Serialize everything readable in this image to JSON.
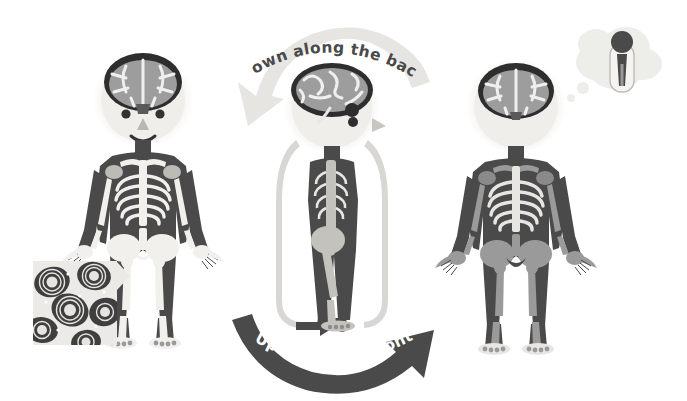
{
  "illustration": {
    "title": "Cerebrospinal fluid circulation through the body",
    "background_color": "#ffffff"
  },
  "palette": {
    "ink_dark": "#3a3a3a",
    "body_dark": "#4a4a4a",
    "bone_light": "#f2f0ec",
    "bone_mid": "#9a9a9a",
    "brain_gray": "#9d9d9d",
    "skin_light": "#eceae6",
    "arrow_light": "#e6e5e2",
    "arrow_dark": "#4a4a4a",
    "text_on_light": "#4a4a4a",
    "text_on_dark": "#ffffff"
  },
  "arrows": {
    "top": {
      "label": "...Down along the back...",
      "fill": "#e6e5e2",
      "text_color": "#4a4a4a",
      "direction": "down-left"
    },
    "bottom": {
      "label": "...Up along the front...",
      "fill": "#4a4a4a",
      "text_color": "#ffffff",
      "direction": "up-right"
    }
  },
  "figures": [
    {
      "id": "left-figure",
      "view": "front",
      "has_face": true,
      "face": {
        "eyes": 2,
        "nose": "triangle",
        "mouth": "smile"
      },
      "brain_view": "superior",
      "bone_color": "#f2f0ec",
      "body_color": "#4a4a4a",
      "inset": {
        "name": "bone-microstructure-inset",
        "description": "osteon / Haversian canal bone tissue magnification",
        "callout": true
      }
    },
    {
      "id": "middle-figure",
      "view": "side-profile",
      "has_face": true,
      "face": {
        "eyes": 1,
        "nose": "triangle",
        "mouth": "none"
      },
      "brain_view": "lateral",
      "bone_color": "#b8b8b8",
      "body_color": "#4a4a4a",
      "loop_arrow": {
        "name": "circulation-loop-arrow",
        "fill": "#d8d7d3",
        "endpoint": "arrowhead-and-dot-at-feet"
      }
    },
    {
      "id": "right-figure",
      "view": "back",
      "has_face": false,
      "brain_view": "coronal",
      "bone_color": "#9a9a9a",
      "body_color": "#4a4a4a",
      "thought_bubble": {
        "name": "thought-bubble",
        "puffs": 3,
        "contents": "tiny standing figure inside capsule"
      }
    }
  ]
}
